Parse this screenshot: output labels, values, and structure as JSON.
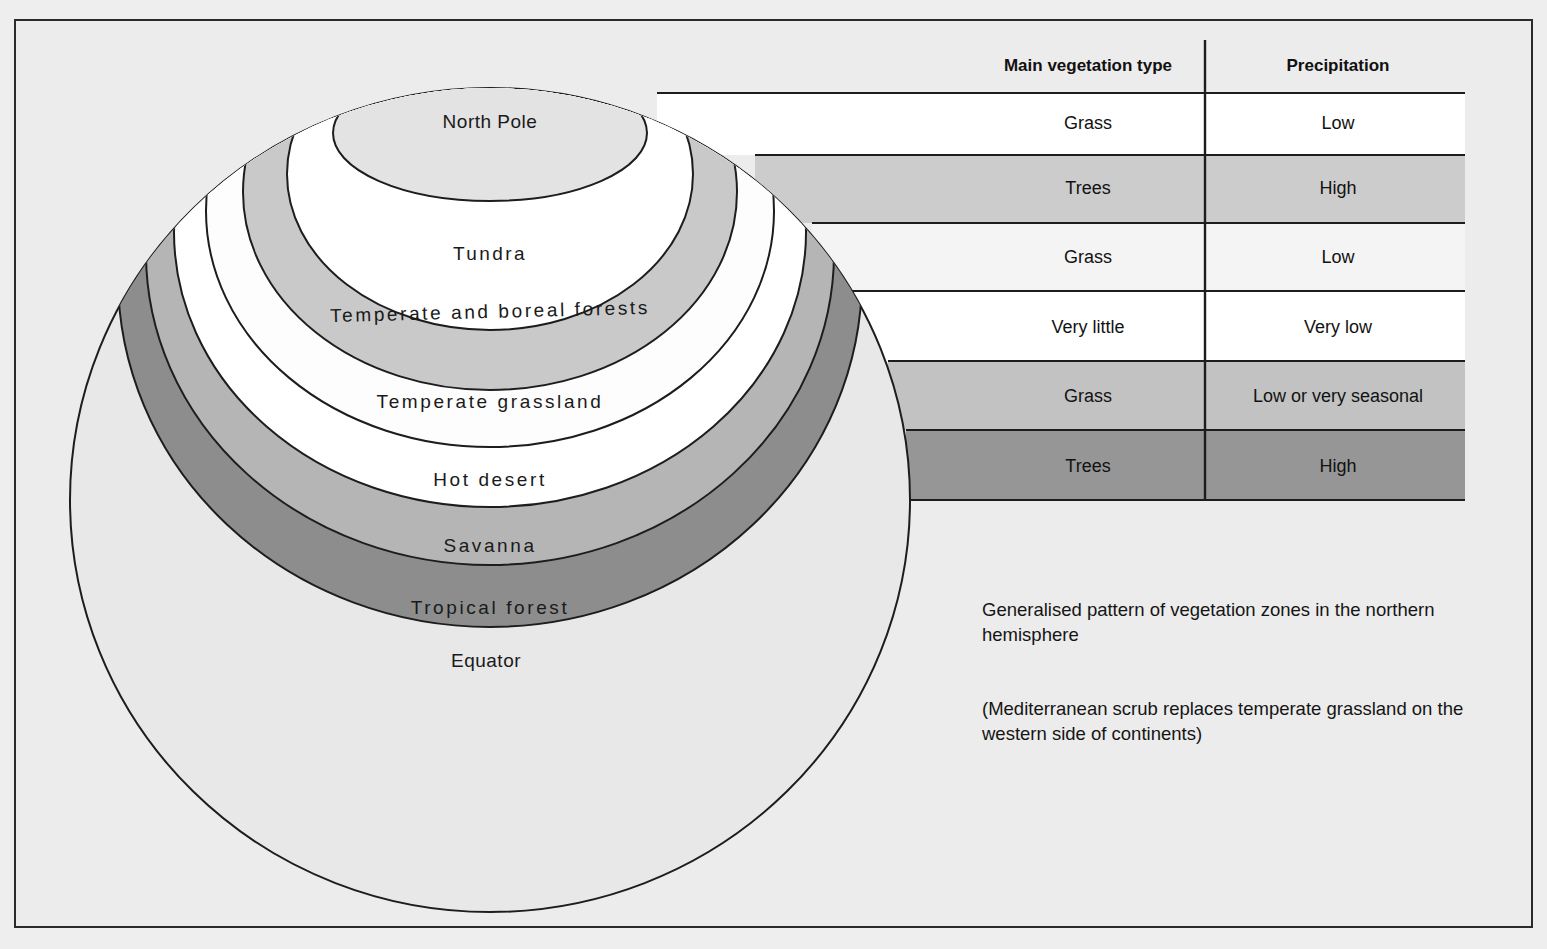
{
  "figure": {
    "kind": "vegetation-zones-diagram",
    "background_color": "#ececec",
    "frame_color": "#2b2b2b"
  },
  "globe": {
    "name": "northern-hemisphere-globe",
    "bands": [
      {
        "id": "north-pole",
        "label": "North Pole",
        "fill": "#e3e3e3"
      },
      {
        "id": "tundra",
        "label": "Tundra",
        "fill": "#ffffff"
      },
      {
        "id": "boreal",
        "label": "Temperate and boreal forests",
        "fill": "#c9c9c9"
      },
      {
        "id": "grassland",
        "label": "Temperate grassland",
        "fill": "#fdfdfd"
      },
      {
        "id": "desert",
        "label": "Hot desert",
        "fill": "#ffffff"
      },
      {
        "id": "savanna",
        "label": "Savanna",
        "fill": "#b5b5b5"
      },
      {
        "id": "tropical",
        "label": "Tropical forest",
        "fill": "#8d8d8d"
      },
      {
        "id": "equator",
        "label": "Equator",
        "fill": "#e8e8e8"
      }
    ]
  },
  "table": {
    "name": "vegetation-precipitation-table",
    "headers": {
      "vegetation": "Main vegetation type",
      "precipitation": "Precipitation"
    },
    "rows": [
      {
        "vegetation": "Grass",
        "precipitation": "Low",
        "fill": "#ffffff",
        "zone": "tundra"
      },
      {
        "vegetation": "Trees",
        "precipitation": "High",
        "fill": "#cccccc",
        "zone": "boreal"
      },
      {
        "vegetation": "Grass",
        "precipitation": "Low",
        "fill": "#f4f4f4",
        "zone": "grassland"
      },
      {
        "vegetation": "Very little",
        "precipitation": "Very low",
        "fill": "#ffffff",
        "zone": "desert"
      },
      {
        "vegetation": "Grass",
        "precipitation": "Low or very seasonal",
        "fill": "#c2c2c2",
        "zone": "savanna"
      },
      {
        "vegetation": "Trees",
        "precipitation": "High",
        "fill": "#969696",
        "zone": "tropical"
      }
    ]
  },
  "captions": {
    "main": "Generalised pattern of vegetation zones in the northern hemisphere",
    "note": "(Mediterranean scrub replaces temperate grassland on the western side of continents)"
  }
}
